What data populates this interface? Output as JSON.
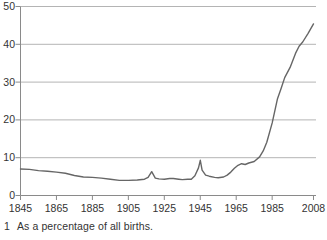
{
  "chart_data": {
    "type": "line",
    "title": "",
    "xlabel": "",
    "ylabel": "",
    "xlim": [
      1845,
      2008
    ],
    "ylim": [
      0,
      50
    ],
    "x_ticks": [
      1845,
      1865,
      1885,
      1905,
      1925,
      1945,
      1965,
      1985,
      2008
    ],
    "y_ticks": [
      0,
      10,
      20,
      30,
      40,
      50
    ],
    "grid": "horizontal",
    "legend": "none",
    "x": [
      1845,
      1850,
      1855,
      1860,
      1865,
      1870,
      1875,
      1880,
      1885,
      1890,
      1895,
      1900,
      1905,
      1910,
      1914,
      1916,
      1918,
      1920,
      1922,
      1925,
      1928,
      1930,
      1933,
      1935,
      1938,
      1940,
      1942,
      1944,
      1945,
      1946,
      1948,
      1950,
      1953,
      1955,
      1958,
      1960,
      1962,
      1964,
      1966,
      1968,
      1970,
      1972,
      1975,
      1978,
      1980,
      1982,
      1985,
      1988,
      1990,
      1992,
      1995,
      1998,
      2000,
      2002,
      2005,
      2008
    ],
    "values": [
      7.0,
      6.9,
      6.6,
      6.4,
      6.2,
      5.9,
      5.3,
      4.9,
      4.8,
      4.6,
      4.3,
      4.0,
      4.0,
      4.1,
      4.3,
      4.8,
      6.3,
      4.6,
      4.4,
      4.3,
      4.5,
      4.5,
      4.3,
      4.2,
      4.3,
      4.3,
      5.2,
      7.3,
      9.3,
      6.7,
      5.4,
      5.1,
      4.8,
      4.7,
      4.9,
      5.4,
      6.2,
      7.2,
      8.0,
      8.4,
      8.2,
      8.6,
      9.0,
      10.2,
      11.8,
      14.1,
      19.2,
      25.6,
      28.3,
      31.2,
      33.9,
      37.6,
      39.5,
      40.6,
      42.9,
      45.4
    ],
    "footnote_marker": "1",
    "footnote": "As a percentage of all births.",
    "colors": {
      "line": "#666666",
      "grid": "#b4b4b4",
      "axis": "#8a8a8a",
      "text": "#333333",
      "background": "#ffffff"
    }
  }
}
